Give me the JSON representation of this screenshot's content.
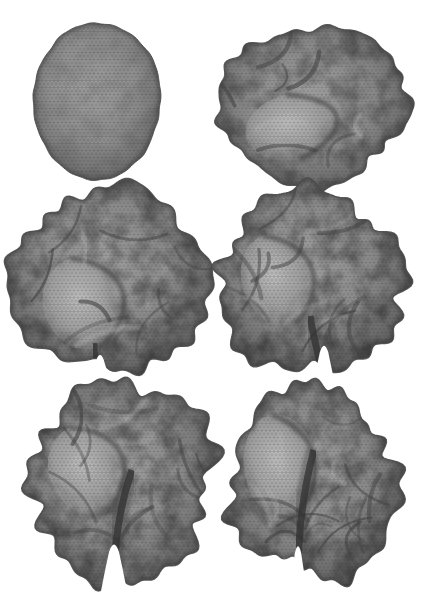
{
  "figure": {
    "type": "mesh-sequence",
    "background_color": "#ffffff",
    "grid": {
      "rows": 3,
      "cols": 2
    },
    "palette": {
      "mesh_base": "#8f8f8f",
      "mesh_highlight": "#bcbcbc",
      "mesh_lines": "#303030",
      "silhouette": "#4a4a4a",
      "crevice": "#353535",
      "gap": "#ffffff"
    },
    "panels": [
      {
        "name": "stage-1-sphere",
        "label": "initial spherical mesh",
        "grid": {
          "row": 1,
          "col": 1
        },
        "cx": 97,
        "cy": 101,
        "rx": 64,
        "ry": 78,
        "bump_low": 0.006,
        "bump_high": 0.003,
        "wrinkles": 0,
        "mottle": 0.14,
        "mesh_opacity": 0.5,
        "seed": 11,
        "fissure": null,
        "bulge": null
      },
      {
        "name": "stage-2-early-folding",
        "label": "flattened blob with first shallow folds",
        "grid": {
          "row": 1,
          "col": 2
        },
        "cx": 313,
        "cy": 105,
        "rx": 97,
        "ry": 77,
        "bump_low": 0.03,
        "bump_high": 0.013,
        "wrinkles": 6,
        "mottle": 0.42,
        "mesh_opacity": 0.45,
        "seed": 23,
        "fissure": null,
        "bulge": {
          "dx": -20,
          "dy": 22,
          "rx": 48,
          "ry": 33,
          "rot": -12
        }
      },
      {
        "name": "stage-3-folding",
        "label": "rounded folded surface with small bottom notch",
        "grid": {
          "row": 2,
          "col": 1
        },
        "cx": 110,
        "cy": 281,
        "rx": 98,
        "ry": 94,
        "bump_low": 0.042,
        "bump_high": 0.02,
        "wrinkles": 9,
        "mottle": 0.48,
        "mesh_opacity": 0.45,
        "seed": 37,
        "fissure": {
          "x_off": -10,
          "w": 15,
          "h": 20,
          "dark": 32,
          "lean": -6
        },
        "bulge": {
          "dx": -25,
          "dy": 22,
          "rx": 42,
          "ry": 47,
          "rot": -18
        }
      },
      {
        "name": "stage-4-folding",
        "label": "deeper folds and growing central fissure",
        "grid": {
          "row": 2,
          "col": 2
        },
        "cx": 311,
        "cy": 283,
        "rx": 90,
        "ry": 95,
        "bump_low": 0.045,
        "bump_high": 0.022,
        "wrinkles": 11,
        "mottle": 0.5,
        "mesh_opacity": 0.45,
        "seed": 41,
        "fissure": {
          "x_off": 13,
          "w": 17,
          "h": 34,
          "dark": 62,
          "lean": -14
        },
        "bulge": {
          "dx": -32,
          "dy": -3,
          "rx": 37,
          "ry": 47,
          "rot": -20
        }
      },
      {
        "name": "stage-5-hemispheres",
        "label": "two hemispheres separating along deep fissure",
        "grid": {
          "row": 3,
          "col": 1
        },
        "cx": 122,
        "cy": 482,
        "rx": 93,
        "ry": 100,
        "bump_low": 0.045,
        "bump_high": 0.022,
        "wrinkles": 12,
        "mottle": 0.5,
        "mesh_opacity": 0.45,
        "seed": 55,
        "fissure": {
          "x_off": -8,
          "w": 20,
          "h": 40,
          "dark": 112,
          "lean": 18
        },
        "bulge": {
          "dx": -34,
          "dy": -12,
          "rx": 39,
          "ry": 46,
          "rot": -24
        }
      },
      {
        "name": "stage-6-brain",
        "label": "final brain-like surface with full interhemispheric fissure",
        "grid": {
          "row": 3,
          "col": 2
        },
        "cx": 314,
        "cy": 483,
        "rx": 81,
        "ry": 99,
        "bump_low": 0.045,
        "bump_high": 0.022,
        "wrinkles": 13,
        "mottle": 0.5,
        "mesh_opacity": 0.45,
        "seed": 67,
        "fissure": {
          "x_off": -16,
          "w": 13,
          "h": 38,
          "dark": 132,
          "lean": 16
        },
        "bulge": {
          "dx": -33,
          "dy": -16,
          "rx": 37,
          "ry": 53,
          "rot": -10
        }
      }
    ]
  }
}
